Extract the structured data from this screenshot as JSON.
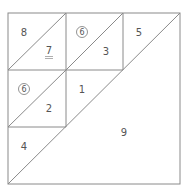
{
  "diagram": {
    "title": "",
    "grid": {
      "x": [
        8,
        66,
        123,
        180
      ],
      "y": [
        13,
        70,
        127,
        184
      ]
    },
    "line_color": "#8a8a8a",
    "text_color": "#555555",
    "regions": [
      {
        "id": "r8",
        "label": "8",
        "x": 24,
        "y": 32,
        "circled": false,
        "underlined": false
      },
      {
        "id": "r7",
        "label": "7",
        "x": 49,
        "y": 50,
        "circled": false,
        "underlined": true
      },
      {
        "id": "r6a",
        "label": "6",
        "x": 82,
        "y": 32,
        "circled": true,
        "underlined": false
      },
      {
        "id": "r3",
        "label": "3",
        "x": 106,
        "y": 51,
        "circled": false,
        "underlined": false
      },
      {
        "id": "r5",
        "label": "5",
        "x": 139,
        "y": 32,
        "circled": false,
        "underlined": false
      },
      {
        "id": "r6b",
        "label": "6",
        "x": 24,
        "y": 89,
        "circled": true,
        "underlined": false
      },
      {
        "id": "r2",
        "label": "2",
        "x": 49,
        "y": 108,
        "circled": false,
        "underlined": false
      },
      {
        "id": "r1",
        "label": "1",
        "x": 82,
        "y": 89,
        "circled": false,
        "underlined": false
      },
      {
        "id": "r4",
        "label": "4",
        "x": 24,
        "y": 146,
        "circled": false,
        "underlined": false
      },
      {
        "id": "r9",
        "label": "9",
        "x": 124,
        "y": 132,
        "circled": false,
        "underlined": false
      }
    ]
  }
}
